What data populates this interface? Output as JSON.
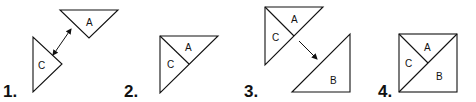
{
  "diagram": {
    "steps": [
      {
        "number": "1.",
        "pieces": [
          "A",
          "C"
        ],
        "action": "move C and A together"
      },
      {
        "number": "2.",
        "pieces": [
          "A",
          "C"
        ],
        "action": "A and C joined"
      },
      {
        "number": "3.",
        "pieces": [
          "A",
          "C",
          "B"
        ],
        "action": "move B toward AC"
      },
      {
        "number": "4.",
        "pieces": [
          "A",
          "C",
          "B"
        ],
        "action": "completed square"
      }
    ],
    "labels": {
      "a": "A",
      "b": "B",
      "c": "C"
    },
    "colors": {
      "stroke": "#111111",
      "background": "#ffffff"
    }
  }
}
